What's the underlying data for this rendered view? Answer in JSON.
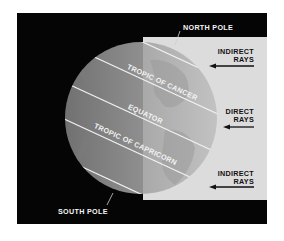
{
  "diagram": {
    "colors": {
      "frame_black": "#050505",
      "lit_background": "#dcdcdc",
      "globe_dark": "#8a8a8a",
      "globe_light": "#b9b9b9",
      "latitude_line": "#f2f2f2",
      "label_text_dark": "#111111",
      "label_text_light": "#f4f4f4"
    },
    "labels": {
      "north_pole": "NORTH POLE",
      "south_pole": "SOUTH POLE",
      "tropic_of_cancer": "TROPIC OF CANCER",
      "equator": "EQUATOR",
      "tropic_of_capricorn": "TROPIC OF CAPRICORN"
    },
    "rays": [
      {
        "line1": "INDIRECT",
        "line2": "RAYS",
        "position": "top"
      },
      {
        "line1": "DIRECT",
        "line2": "RAYS",
        "position": "middle"
      },
      {
        "line1": "INDIRECT",
        "line2": "RAYS",
        "position": "bottom"
      }
    ]
  }
}
